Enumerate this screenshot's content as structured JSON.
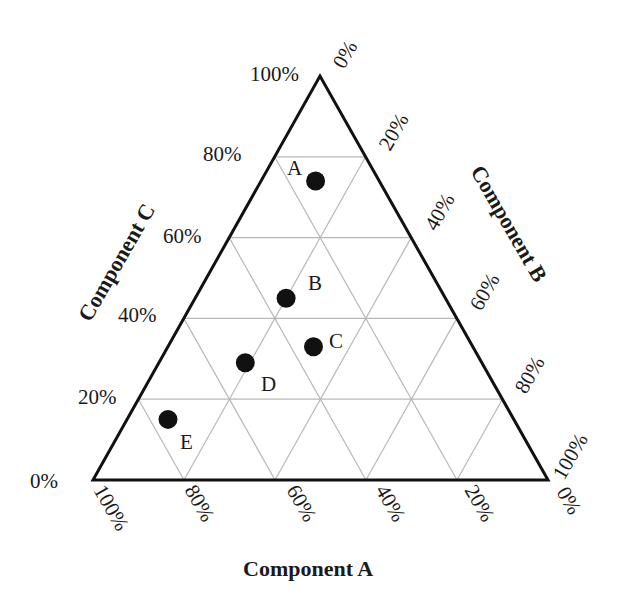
{
  "chart_data": {
    "type": "ternary",
    "title": "",
    "axes": {
      "a": {
        "label": "Component A",
        "position": "bottom",
        "ticks": [
          "100%",
          "80%",
          "60%",
          "40%",
          "20%",
          "0%"
        ]
      },
      "b": {
        "label": "Component B",
        "position": "right",
        "ticks": [
          "0%",
          "20%",
          "40%",
          "60%",
          "80%",
          "100%"
        ]
      },
      "c": {
        "label": "Component C",
        "position": "left",
        "ticks": [
          "0%",
          "20%",
          "40%",
          "60%",
          "80%",
          "100%"
        ]
      }
    },
    "grid": true,
    "grid_step_percent": 20,
    "points": [
      {
        "label": "A",
        "a": 14,
        "b": 12,
        "c": 74
      },
      {
        "label": "B",
        "a": 35,
        "b": 20,
        "c": 45
      },
      {
        "label": "C",
        "a": 35,
        "b": 32,
        "c": 33
      },
      {
        "label": "D",
        "a": 52,
        "b": 19,
        "c": 29
      },
      {
        "label": "E",
        "a": 76,
        "b": 9,
        "c": 15
      }
    ]
  },
  "colors": {
    "frame": "#111111",
    "grid": "#b8b8b8",
    "point": "#111111",
    "text": "#1a1a1a"
  },
  "labels": {
    "axis_a": "Component A",
    "axis_b": "Component B",
    "axis_c": "Component C",
    "c_ticks": [
      "0%",
      "20%",
      "40%",
      "60%",
      "80%",
      "100%"
    ],
    "b_ticks": [
      "0%",
      "20%",
      "40%",
      "60%",
      "80%",
      "100%"
    ],
    "a_ticks": [
      "100%",
      "80%",
      "60%",
      "40%",
      "20%",
      "0%"
    ],
    "points": [
      "A",
      "B",
      "C",
      "D",
      "E"
    ]
  }
}
